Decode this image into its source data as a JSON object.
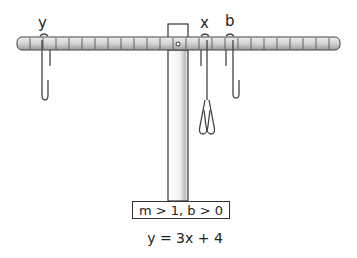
{
  "diagram": {
    "labels": {
      "y": "y",
      "x": "x",
      "b": "b"
    },
    "condition": "m > 1, b > 0",
    "equation": "y = 3x + 4",
    "colors": {
      "stroke": "#333333",
      "beam_fill": "#d9d9d9",
      "background": "#ffffff"
    }
  }
}
